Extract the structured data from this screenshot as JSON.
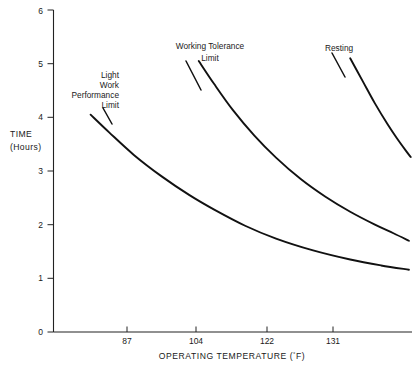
{
  "chart_data": {
    "type": "line",
    "title": "",
    "subtitle": "",
    "xlabel": "OPERATING TEMPERATURE (°F)",
    "ylabel_line1": "TIME",
    "ylabel_line2": "(Hours)",
    "xlim": [
      78,
      136
    ],
    "ylim": [
      0,
      6
    ],
    "grid": false,
    "legend_position": "inline-annotations",
    "x_ticks": [
      87,
      104,
      122,
      131
    ],
    "x_tick_labels": [
      "87",
      "104",
      "122",
      "131"
    ],
    "y_ticks": [
      0,
      1,
      2,
      3,
      4,
      5,
      6
    ],
    "y_tick_labels": [
      "0",
      "1",
      "2",
      "3",
      "4",
      "5",
      "6"
    ],
    "series": [
      {
        "name": "Light Work Performance Limit",
        "label_lines": [
          "Light",
          "Work",
          "Performance",
          "Limit"
        ],
        "x": [
          84.0,
          87.0,
          91.0,
          95.5,
          100.0,
          104.0,
          109.0,
          114.0,
          120.0,
          126.0,
          131.0,
          135.5
        ],
        "y": [
          4.05,
          3.72,
          3.3,
          2.9,
          2.55,
          2.28,
          1.98,
          1.74,
          1.52,
          1.35,
          1.24,
          1.16
        ]
      },
      {
        "name": "Working Tolerance Limit",
        "label_lines": [
          "Working Tolerance",
          "Limit"
        ],
        "x": [
          101.5,
          104.0,
          107.0,
          110.5,
          114.0,
          118.0,
          122.0,
          126.0,
          130.0,
          133.0,
          135.5
        ],
        "y": [
          5.05,
          4.62,
          4.14,
          3.66,
          3.25,
          2.85,
          2.52,
          2.24,
          2.0,
          1.84,
          1.7
        ]
      },
      {
        "name": "Resting",
        "label_lines": [
          "Resting"
        ],
        "x": [
          126.0,
          128.0,
          130.0,
          132.0,
          133.5,
          135.0,
          135.8
        ],
        "y": [
          5.1,
          4.68,
          4.26,
          3.88,
          3.62,
          3.38,
          3.26
        ]
      }
    ]
  },
  "annotations": {
    "light_work": {
      "lines": [
        "Light",
        "Work",
        "Performance",
        "Limit"
      ]
    },
    "working_tolerance": {
      "lines": [
        "Working Tolerance",
        "Limit"
      ]
    },
    "resting": {
      "lines": [
        "Resting"
      ]
    }
  },
  "axes": {
    "y_label_top": "TIME",
    "y_label_bottom": "(Hours)",
    "x_label_text": "OPERATING TEMPERATURE (",
    "x_label_degree": "°",
    "x_label_tail": "F)"
  },
  "colors": {
    "curve": "#111111",
    "axis": "#222222",
    "text": "#1a1a1a",
    "background": "#ffffff"
  }
}
